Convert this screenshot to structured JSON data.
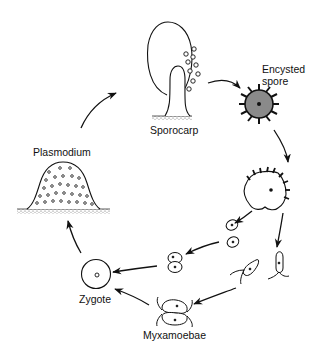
{
  "diagram": {
    "type": "cycle",
    "colors": {
      "stroke": "#111111",
      "spore_fill": "#8a8a8a",
      "background": "#ffffff"
    },
    "nodes": [
      {
        "id": "sporocarp",
        "label": "Sporocarp"
      },
      {
        "id": "encysted_spore",
        "label": "Encysted\nspore",
        "label_line1": "Encysted",
        "label_line2": "spore"
      },
      {
        "id": "germinating_spore",
        "label": ""
      },
      {
        "id": "swarm_cells",
        "label": ""
      },
      {
        "id": "myxamoebae",
        "label": "Myxamoebae"
      },
      {
        "id": "zygote",
        "label": "Zygote"
      },
      {
        "id": "plasmodium",
        "label": "Plasmodium"
      }
    ],
    "edges": [
      {
        "from": "sporocarp",
        "to": "encysted_spore"
      },
      {
        "from": "encysted_spore",
        "to": "germinating_spore"
      },
      {
        "from": "germinating_spore",
        "to": "swarm_cells"
      },
      {
        "from": "germinating_spore",
        "to": "myxamoebae"
      },
      {
        "from": "swarm_cells",
        "to": "zygote"
      },
      {
        "from": "myxamoebae",
        "to": "zygote"
      },
      {
        "from": "zygote",
        "to": "plasmodium"
      },
      {
        "from": "plasmodium",
        "to": "sporocarp"
      }
    ]
  }
}
